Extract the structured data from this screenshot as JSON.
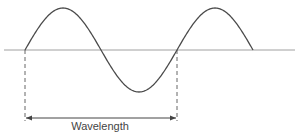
{
  "diagram": {
    "label": "Wavelength",
    "colors": {
      "wave": "#4a4a4a",
      "axis": "#a0a0a0",
      "dashed": "#555555",
      "arrow": "#444444",
      "text": "#444444"
    },
    "axis": {
      "y": 50,
      "x_start": 4,
      "x_end": 295
    },
    "wave": {
      "x_start": 25,
      "x_end": 253,
      "wavelength_px": 152,
      "amplitude_px": 42
    },
    "wavelength_marker": {
      "x_left": 25,
      "x_right": 177,
      "dash_bottom": 121,
      "arrow_y": 118,
      "label_x": 100,
      "label_y": 120
    }
  }
}
